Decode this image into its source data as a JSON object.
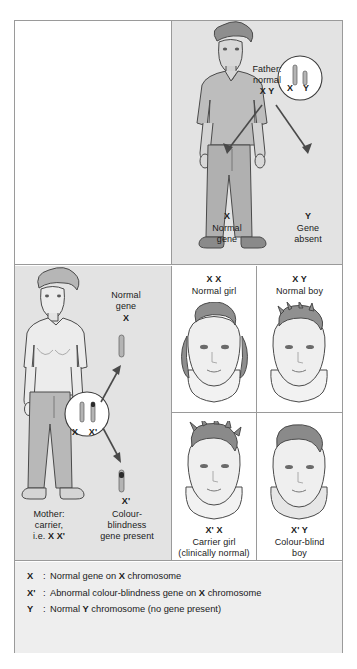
{
  "figure": {
    "colors": {
      "panel_gray": "#e3e3e3",
      "panel_white": "#ffffff",
      "legend_gray": "#eeeeee",
      "border": "#9a9a9a",
      "ink": "#1a1a1a",
      "chromosome_fill": "#b4b4b4",
      "gene_band": "#2b2b2b"
    }
  },
  "father": {
    "figure_name": "standing-man",
    "label_line1": "Father:",
    "label_line2": "normal",
    "genotype": "X Y",
    "karyotype_circle": {
      "icon": "chromosome-pair-circle",
      "chromosome_left": "X",
      "chromosome_right": "Y"
    },
    "gametes": [
      {
        "symbol": "X",
        "line1": "Normal",
        "line2": "gene"
      },
      {
        "symbol": "Y",
        "line1": "Gene",
        "line2": "absent"
      }
    ]
  },
  "mother": {
    "figure_name": "standing-woman",
    "label_line1": "Mother:",
    "label_line2": "carrier,",
    "label_line3_prefix": "i.e. ",
    "genotype": "X X'",
    "karyotype_circle": {
      "icon": "chromosome-pair-circle",
      "chromosome_left": "X",
      "chromosome_right": "X'"
    },
    "gamete_normal": {
      "line1": "Normal",
      "line2": "gene",
      "symbol": "X"
    },
    "gamete_affected": {
      "symbol": "X'",
      "line1": "Colour-",
      "line2": "blindness",
      "line3": "gene present"
    }
  },
  "offspring": [
    {
      "id": "normal-girl",
      "genotype": "X X",
      "description_line1": "Normal girl",
      "description_line2": "",
      "portrait": "girl-portrait"
    },
    {
      "id": "normal-boy",
      "genotype": "X Y",
      "description_line1": "Normal boy",
      "description_line2": "",
      "portrait": "boy-portrait"
    },
    {
      "id": "carrier-girl",
      "genotype": "X' X",
      "description_line1": "Carrier girl",
      "description_line2": "(clinically normal)",
      "portrait": "girl-portrait"
    },
    {
      "id": "colour-blind-boy",
      "genotype": "X' Y",
      "description_line1": "Colour-blind",
      "description_line2": "boy",
      "portrait": "boy-portrait"
    }
  ],
  "legend": [
    {
      "key": "X",
      "colon": ":",
      "text": "Normal gene on X chromosome",
      "text_parts": [
        "Normal gene on ",
        "X",
        " chromosome"
      ]
    },
    {
      "key": "X'",
      "colon": ":",
      "text": "Abnormal colour-blindness gene on X chromosome",
      "text_parts": [
        "Abnormal colour-blindness gene on ",
        "X",
        " chromosome"
      ]
    },
    {
      "key": "Y",
      "colon": ":",
      "text": "Normal Y chromosome (no gene present)",
      "text_parts": [
        "Normal ",
        "Y",
        " chromosome (no gene present)"
      ]
    }
  ]
}
